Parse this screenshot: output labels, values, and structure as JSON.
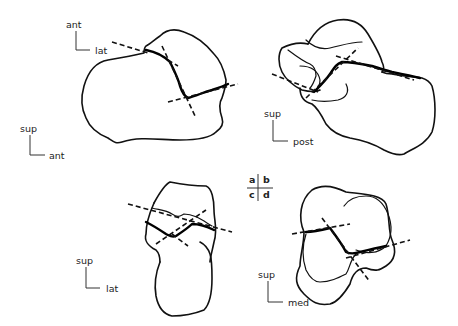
{
  "figure": {
    "panels": [
      {
        "id": "a",
        "orientation": {
          "vertical": "ant",
          "horizontal": "lat"
        },
        "secondary_orientation": {
          "vertical": "sup",
          "horizontal": "ant"
        }
      },
      {
        "id": "b",
        "orientation": {
          "vertical": "sup",
          "horizontal": "post"
        }
      },
      {
        "id": "c",
        "orientation": {
          "vertical": "sup",
          "horizontal": "lat"
        }
      },
      {
        "id": "d",
        "orientation": {
          "vertical": "sup",
          "horizontal": "med"
        }
      }
    ],
    "key": {
      "top_left": "a",
      "top_right": "b",
      "bottom_left": "c",
      "bottom_right": "d"
    }
  }
}
